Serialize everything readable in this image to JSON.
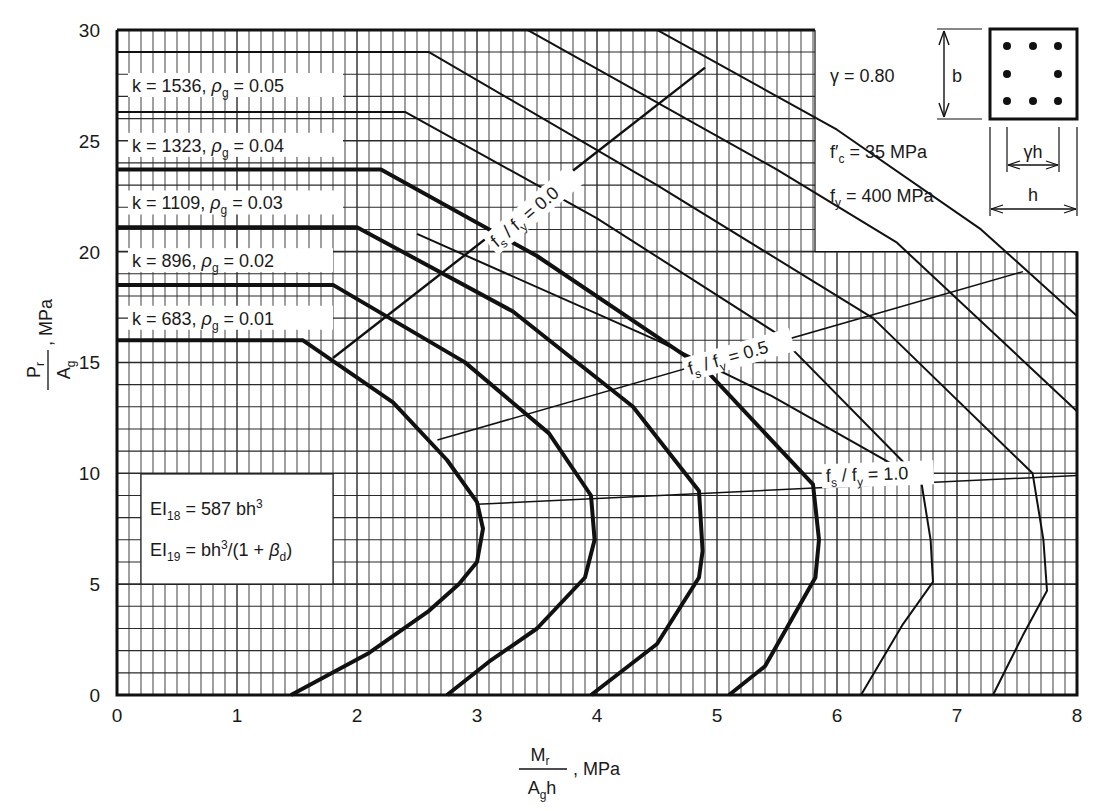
{
  "chart_data": {
    "type": "line",
    "title": "",
    "xlabel": "Mr / (Ag h), MPa",
    "ylabel": "Pr / Ag, MPa",
    "xlim": [
      0,
      8
    ],
    "ylim": [
      0,
      30
    ],
    "x_ticks": [
      "0",
      "1",
      "2",
      "3",
      "4",
      "5",
      "6",
      "7",
      "8"
    ],
    "y_ticks": [
      "0",
      "5",
      "10",
      "15",
      "20",
      "25",
      "30"
    ],
    "grid": true,
    "parameters": {
      "gamma": "γ  =  0.80",
      "fc": "35  MPa",
      "fy": "400  MPa"
    },
    "section_labels": {
      "b": "b",
      "gh": "γh",
      "h": "h"
    },
    "ei_box": {
      "line1": "587 bh",
      "line2": "bh"
    },
    "series": [
      {
        "name": "k = 683, ρg = 0.01",
        "k": "683",
        "rho": "0.01",
        "weight": "thick",
        "points": [
          [
            0,
            16
          ],
          [
            1.55,
            16
          ],
          [
            2.3,
            13.2
          ],
          [
            2.75,
            10.6
          ],
          [
            3.0,
            8.7
          ],
          [
            3.05,
            7.5
          ],
          [
            3.0,
            6.0
          ],
          [
            2.85,
            5.0
          ],
          [
            2.6,
            3.8
          ],
          [
            2.1,
            1.9
          ],
          [
            1.45,
            0
          ]
        ]
      },
      {
        "name": "k = 896, ρg = 0.02",
        "k": "896",
        "rho": "0.02",
        "weight": "thick",
        "points": [
          [
            0,
            18.5
          ],
          [
            1.8,
            18.5
          ],
          [
            2.9,
            15.0
          ],
          [
            3.6,
            11.8
          ],
          [
            3.95,
            9.0
          ],
          [
            3.98,
            7.0
          ],
          [
            3.9,
            5.3
          ],
          [
            3.5,
            3.0
          ],
          [
            3.1,
            1.5
          ],
          [
            2.75,
            0
          ]
        ]
      },
      {
        "name": "k = 1109, ρg = 0.03",
        "k": "1109",
        "rho": "0.03",
        "weight": "thick",
        "points": [
          [
            0,
            21.1
          ],
          [
            2.0,
            21.1
          ],
          [
            3.3,
            17.3
          ],
          [
            4.3,
            13.0
          ],
          [
            4.85,
            9.2
          ],
          [
            4.88,
            6.5
          ],
          [
            4.85,
            5.3
          ],
          [
            4.5,
            2.3
          ],
          [
            3.95,
            0
          ]
        ]
      },
      {
        "name": "k = 1323, ρg = 0.04",
        "k": "1323",
        "rho": "0.04",
        "weight": "thick",
        "points": [
          [
            0,
            23.7
          ],
          [
            2.2,
            23.7
          ],
          [
            3.5,
            19.8
          ],
          [
            4.9,
            14.7
          ],
          [
            5.8,
            9.5
          ],
          [
            5.85,
            7.0
          ],
          [
            5.82,
            5.3
          ],
          [
            5.4,
            1.3
          ],
          [
            5.1,
            0
          ]
        ]
      },
      {
        "name": "ρg = 0.05 (26.3)",
        "k": "1536",
        "rho": "0.05",
        "weight": "thin",
        "points": [
          [
            0,
            26.3
          ],
          [
            2.4,
            26.3
          ],
          [
            4.0,
            21.5
          ],
          [
            5.5,
            16.3
          ],
          [
            6.7,
            9.7
          ],
          [
            6.78,
            7.0
          ],
          [
            6.8,
            5.1
          ],
          [
            6.55,
            3.2
          ],
          [
            6.2,
            0
          ]
        ]
      },
      {
        "name": "ρg = 0.05 (29)",
        "k": "1536",
        "rho": "0.05",
        "weight": "thin",
        "points": [
          [
            0,
            29
          ],
          [
            2.6,
            29
          ],
          [
            4.5,
            23.0
          ],
          [
            6.3,
            17.0
          ],
          [
            7.63,
            10.0
          ],
          [
            7.72,
            7.0
          ],
          [
            7.75,
            4.7
          ],
          [
            7.55,
            2.7
          ],
          [
            7.3,
            0
          ]
        ]
      },
      {
        "name": "upper curve 1",
        "weight": "thin",
        "points": [
          [
            3.42,
            30
          ],
          [
            5.5,
            23.7
          ],
          [
            6.5,
            20.4
          ],
          [
            8.0,
            12.8
          ]
        ]
      },
      {
        "name": "upper curve 2",
        "weight": "thin",
        "points": [
          [
            4.5,
            30
          ],
          [
            6.0,
            25.5
          ],
          [
            7.2,
            21.0
          ],
          [
            8.0,
            17.1
          ]
        ]
      },
      {
        "name": "line stub",
        "weight": "thin",
        "points": [
          [
            2.5,
            20.8
          ],
          [
            4.5,
            16.0
          ],
          [
            5.45,
            13.5
          ],
          [
            6.53,
            10.2
          ]
        ]
      }
    ],
    "fs_fy_lines": [
      {
        "label": "fs / fy = 0.0",
        "value": "0.0",
        "points": [
          [
            1.8,
            15.2
          ],
          [
            4.9,
            28.3
          ]
        ]
      },
      {
        "label": "fs / fy = 0.5",
        "value": "0.5",
        "points": [
          [
            2.67,
            11.5
          ],
          [
            7.55,
            19.1
          ]
        ]
      },
      {
        "label": "fs / fy = 1.0",
        "value": "1.0",
        "points": [
          [
            3.0,
            8.6
          ],
          [
            8.0,
            9.9
          ]
        ]
      }
    ]
  }
}
